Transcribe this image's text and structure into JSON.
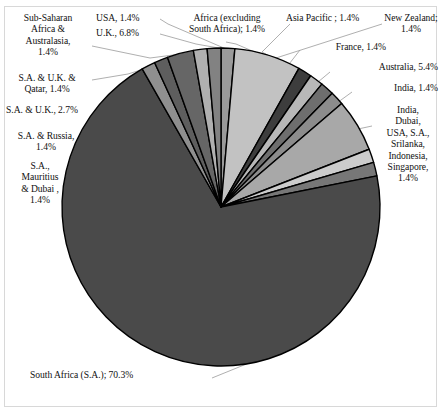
{
  "chart_data": {
    "type": "pie",
    "title": "",
    "subtitle": "",
    "xlabel": "",
    "ylabel": "",
    "legend_position": "none",
    "grid": false,
    "units": "percent",
    "total": 100.0,
    "start_angle_deg": 0,
    "direction": "clockwise",
    "categories": [
      "Africa (excluding South Africa)",
      "Asia Pacific ",
      "New Zealand",
      "France",
      "Australia",
      "India",
      "India, Dubai, USA, S.A., Srilanka, Indonesia, Singapore",
      "South Africa (S.A.)",
      "S.A., Mauritius & Dubai ",
      "S.A. & Russia",
      "S.A. & U.K.",
      "S.A. & U.K. & Qatar",
      "Sub-Saharan Africa & Australasia",
      "U.K.",
      "USA"
    ],
    "values": [
      1.4,
      1.4,
      1.4,
      1.4,
      5.4,
      1.4,
      1.4,
      70.3,
      1.4,
      1.4,
      2.7,
      1.4,
      1.4,
      6.8,
      1.4
    ],
    "slices": [
      {
        "name": "USA",
        "value": 1.4,
        "color": "#9a9a9a",
        "label_text": "USA, 1.4%"
      },
      {
        "name": "U.K.",
        "value": 6.8,
        "color": "#c2c2c2",
        "label_text": "U.K., 6.8%"
      },
      {
        "name": "Africa (excluding South Africa)",
        "value": 1.4,
        "color": "#3d3d3d",
        "label_text": "Africa (excluding\nSouth Africa); 1.4%"
      },
      {
        "name": "Asia Pacific ",
        "value": 1.4,
        "color": "#b8b8b8",
        "label_text": "Asia Pacific ; 1.4%"
      },
      {
        "name": "New Zealand",
        "value": 1.4,
        "color": "#6e6e6e",
        "label_text": "New Zealand;\n1.4%"
      },
      {
        "name": "France",
        "value": 1.4,
        "color": "#8c8c8c",
        "label_text": "France, 1.4%"
      },
      {
        "name": "Australia",
        "value": 5.4,
        "color": "#a8a8a8",
        "label_text": "Australia, 5.4%"
      },
      {
        "name": "India",
        "value": 1.4,
        "color": "#cccccc",
        "label_text": "India, 1.4%"
      },
      {
        "name": "India, Dubai, USA, S.A., Srilanka, Indonesia, Singapore",
        "value": 1.4,
        "color": "#777777",
        "label_text": "India,\nDubai,\nUSA, S.A.,\nSrilanka,\nIndonesia,\nSingapore,\n1.4%"
      },
      {
        "name": "South Africa (S.A.)",
        "value": 70.3,
        "color": "#4a4a4a",
        "label_text": "South Africa (S.A.); 70.3%"
      },
      {
        "name": "S.A., Mauritius & Dubai ",
        "value": 1.4,
        "color": "#8f8f8f",
        "label_text": "S.A.,\nMauritius\n& Dubai ,\n1.4%"
      },
      {
        "name": "S.A. & Russia",
        "value": 1.4,
        "color": "#5e5e5e",
        "label_text": "S.A. & Russia,\n1.4%"
      },
      {
        "name": "S.A. & U.K.",
        "value": 2.7,
        "color": "#666666",
        "label_text": "S.A. & U.K., 2.7%"
      },
      {
        "name": "S.A. & U.K. & Qatar",
        "value": 1.4,
        "color": "#b0b0b0",
        "label_text": "S.A. & U.K. &\nQatar, 1.4%"
      },
      {
        "name": "Sub-Saharan Africa & Australasia",
        "value": 1.4,
        "color": "#828282",
        "label_text": "Sub-Saharan\nAfrica &\nAustralasia,\n1.4%"
      }
    ]
  },
  "labels": {
    "sub_saharan": "Sub-Saharan\nAfrica &\nAustralasia,\n1.4%",
    "usa": "USA, 1.4%",
    "uk": "U.K., 6.8%",
    "africa_excl": "Africa (excluding\nSouth Africa); 1.4%",
    "asia_pacific": "Asia Pacific ; 1.4%",
    "new_zealand": "New Zealand;\n1.4%",
    "france": "France, 1.4%",
    "australia": "Australia, 5.4%",
    "india": "India, 1.4%",
    "india_multi": "India,\nDubai,\nUSA, S.A.,\nSrilanka,\nIndonesia,\nSingapore,\n1.4%",
    "sa_uk_qatar": "S.A. & U.K. &\nQatar, 1.4%",
    "sa_uk": "S.A. & U.K., 2.7%",
    "sa_russia": "S.A. & Russia,\n1.4%",
    "sa_mauritius": "S.A.,\nMauritius\n& Dubai ,\n1.4%",
    "south_africa": "South Africa (S.A.); 70.3%"
  },
  "style": {
    "background": "#ffffff",
    "frame_color": "#d8d8d8",
    "slice_outline": "#000000",
    "leader_color": "#9a9a9a",
    "text_color": "#111111"
  },
  "geometry": {
    "center_x": 221,
    "center_y": 207,
    "radius": 159
  }
}
